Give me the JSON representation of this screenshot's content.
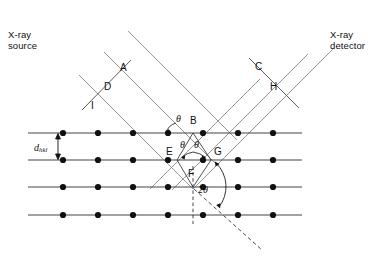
{
  "figure": {
    "type": "bragg-diffraction-diagram",
    "width": 387,
    "height": 256,
    "background_color": "#ffffff"
  },
  "annotations": {
    "source_label": "X-ray\nsource",
    "detector_label": "X-ray\ndetector",
    "spacing_symbol": "d",
    "spacing_subscript": "hkl",
    "theta_symbol": "θ",
    "two_theta_symbol": "2θ"
  },
  "points": [
    {
      "id": "A",
      "label": "A",
      "x": 121,
      "y": 69
    },
    {
      "id": "D",
      "label": "D",
      "x": 109,
      "y": 88
    },
    {
      "id": "I",
      "label": "I",
      "x": 95,
      "y": 107
    },
    {
      "id": "C",
      "label": "C",
      "x": 259,
      "y": 68
    },
    {
      "id": "H",
      "label": "H",
      "x": 274,
      "y": 88
    },
    {
      "id": "B",
      "label": "B",
      "x": 194,
      "y": 122
    },
    {
      "id": "E",
      "label": "E",
      "x": 171,
      "y": 151
    },
    {
      "id": "G",
      "label": "G",
      "x": 217,
      "y": 151
    },
    {
      "id": "F",
      "label": "F",
      "x": 192,
      "y": 175
    }
  ],
  "angle_labels": [
    {
      "id": "theta-incident",
      "text": "θ",
      "x": 177,
      "y": 117
    },
    {
      "id": "theta-left",
      "text": "θ",
      "x": 182,
      "y": 143
    },
    {
      "id": "theta-right",
      "text": "θ",
      "x": 196,
      "y": 143
    },
    {
      "id": "two-theta",
      "text": "2θ",
      "x": 202,
      "y": 190
    }
  ],
  "lattice": {
    "rows_y": [
      133,
      160,
      187,
      215
    ],
    "row_x_start": 28,
    "row_x_end": 302,
    "dot_x": [
      63,
      98,
      133,
      168,
      203,
      238,
      273
    ],
    "dot_radius": 3.1,
    "dot_color": "#111111",
    "line_color": "#444444",
    "interplanar_spacing_label": "d",
    "interplanar_spacing_sub": "hkl"
  },
  "beams": {
    "incident_color": "#8a8a8a",
    "diffracted_color": "#8a8a8a",
    "dashed_color": "#333333",
    "incident_direction_deg": 45,
    "diffracted_direction_deg": -45,
    "incident_count": 3,
    "diffracted_count": 3
  },
  "colors": {
    "stroke_dark": "#111111",
    "stroke_gray": "#8a8a8a",
    "lattice_line": "#444444",
    "dot": "#111111",
    "background": "#ffffff"
  }
}
